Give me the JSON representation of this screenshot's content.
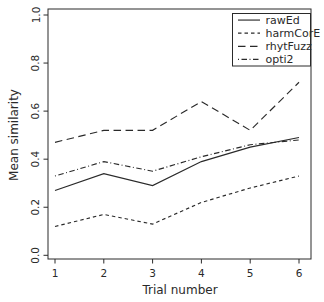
{
  "figure": {
    "background": "#ffffff",
    "foreground": "#2a2a2a"
  },
  "chart_data": {
    "type": "line",
    "title": "",
    "xlabel": "Trial number",
    "ylabel": "Mean similarity",
    "x": [
      1,
      2,
      3,
      4,
      5,
      6
    ],
    "x_tick_labels": [
      "1",
      "2",
      "3",
      "4",
      "5",
      "6"
    ],
    "y_ticks": [
      0.0,
      0.2,
      0.4,
      0.6,
      0.8,
      1.0
    ],
    "y_tick_labels": [
      "0.0",
      "0.2",
      "0.4",
      "0.6",
      "0.8",
      "1.0"
    ],
    "xlim": [
      1,
      6
    ],
    "ylim": [
      0,
      1
    ],
    "grid": false,
    "legend_position": "top-right",
    "line_color": "#2a2a2a",
    "series": [
      {
        "name": "rawEd",
        "linetype": "solid",
        "values": [
          0.27,
          0.34,
          0.29,
          0.39,
          0.45,
          0.49
        ]
      },
      {
        "name": "harmCorE",
        "linetype": "dashed",
        "values": [
          0.12,
          0.17,
          0.13,
          0.22,
          0.28,
          0.33
        ]
      },
      {
        "name": "rhytFuzz",
        "linetype": "longdash",
        "values": [
          0.47,
          0.52,
          0.52,
          0.64,
          0.52,
          0.72
        ]
      },
      {
        "name": "opti2",
        "linetype": "dotdash",
        "values": [
          0.33,
          0.39,
          0.35,
          0.41,
          0.46,
          0.48
        ]
      }
    ]
  }
}
